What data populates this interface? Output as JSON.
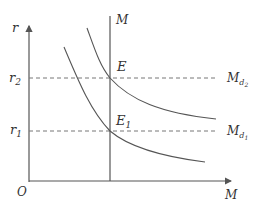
{
  "diagram": {
    "axes": {
      "y_label": "r",
      "x_label": "M",
      "origin_label": "O"
    },
    "supply_line": {
      "label": "M"
    },
    "interest_levels": [
      {
        "label_base": "r",
        "label_sub": "2"
      },
      {
        "label_base": "r",
        "label_sub": "1"
      }
    ],
    "demand_curves": [
      {
        "label_base": "M",
        "label_sub": "d",
        "label_subsub": "2"
      },
      {
        "label_base": "M",
        "label_sub": "d",
        "label_subsub": "1"
      }
    ],
    "points": [
      {
        "label_base": "E",
        "label_sub": ""
      },
      {
        "label_base": "E",
        "label_sub": "1"
      }
    ],
    "colors": {
      "line": "#555555",
      "text": "#333333",
      "dash": "#777777"
    }
  }
}
